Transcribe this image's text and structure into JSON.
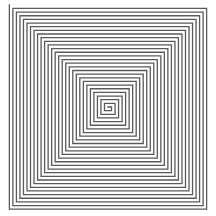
{
  "figure": {
    "background": "#ffffff",
    "stroke_color": "#5a5a5a",
    "stroke_width": 1.3,
    "center": [
      108,
      107
    ],
    "start_offset": 3,
    "step": 3.65,
    "turns": 28,
    "scale_x": 0.965,
    "scale_y": 1.0
  }
}
